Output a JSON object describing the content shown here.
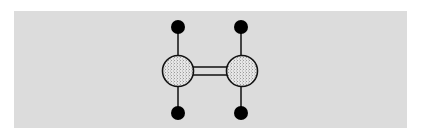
{
  "diagram": {
    "title": "",
    "background_color": "#dcdcdc",
    "atoms": [
      {
        "id": "C1",
        "type": "carbon",
        "cx": 178,
        "cy": 71,
        "r": 15.5,
        "fill": "#e4e4e4",
        "pattern": "stipple"
      },
      {
        "id": "C2",
        "type": "carbon",
        "cx": 242,
        "cy": 71,
        "r": 15.5,
        "fill": "#e4e4e4",
        "pattern": "stipple"
      },
      {
        "id": "H1",
        "type": "hydrogen",
        "cx": 178,
        "cy": 27,
        "r": 7,
        "fill": "#000000"
      },
      {
        "id": "H2",
        "type": "hydrogen",
        "cx": 241,
        "cy": 27,
        "r": 7,
        "fill": "#000000"
      },
      {
        "id": "H3",
        "type": "hydrogen",
        "cx": 178,
        "cy": 113,
        "r": 7,
        "fill": "#000000"
      },
      {
        "id": "H4",
        "type": "hydrogen",
        "cx": 241,
        "cy": 113,
        "r": 7,
        "fill": "#000000"
      }
    ],
    "bonds": [
      {
        "from": "C1",
        "to": "C2",
        "order": 2
      },
      {
        "from": "C1",
        "to": "H1",
        "order": 1
      },
      {
        "from": "C1",
        "to": "H3",
        "order": 1
      },
      {
        "from": "C2",
        "to": "H2",
        "order": 1
      },
      {
        "from": "C2",
        "to": "H4",
        "order": 1
      }
    ]
  }
}
